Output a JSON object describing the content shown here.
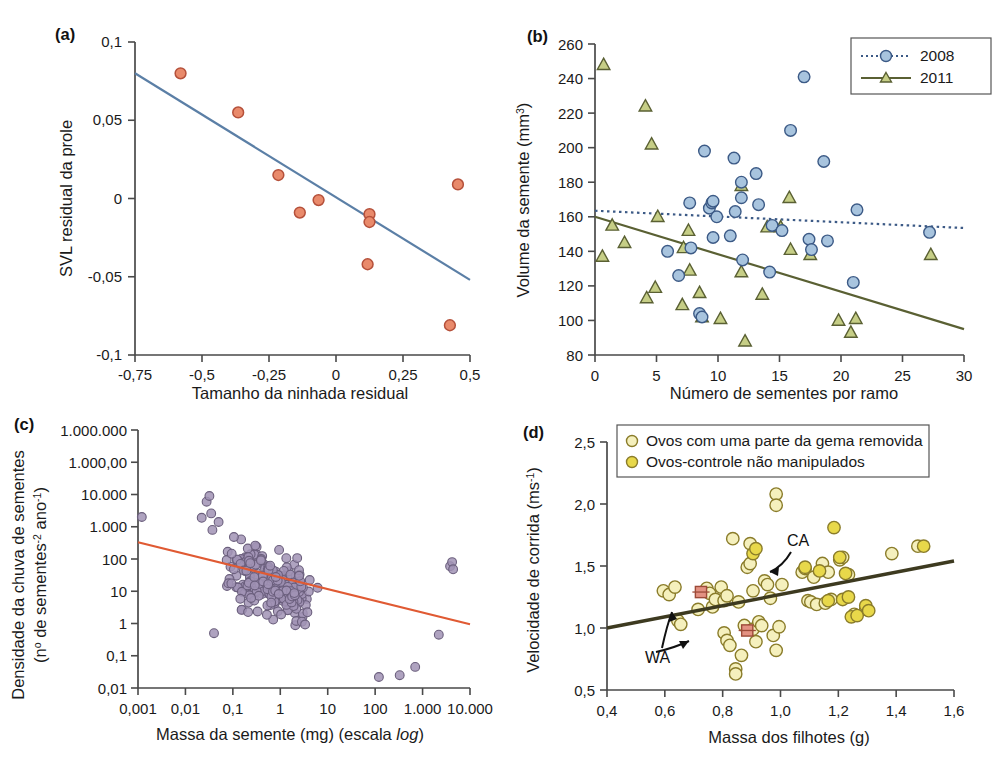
{
  "figure": {
    "kind": "multi-panel-scatter-figure",
    "panels": [
      "a",
      "b",
      "c",
      "d"
    ]
  },
  "panels": {
    "a": {
      "tag": "(a)",
      "xlabel": "Tamanho da ninhada residual",
      "ylabel": "SVL residual da prole",
      "xticks": [
        "-0,75",
        "-0,5",
        "-0,25",
        "0",
        "0,25",
        "0,5"
      ],
      "yticks": [
        "0,1",
        "0,05",
        "0",
        "-0,05",
        "-0,1"
      ]
    },
    "b": {
      "tag": "(b)",
      "xlabel": "Número de sementes por ramo",
      "ylabel_main": "Volume da semente (mm",
      "ylabel_sup": "3",
      "ylabel_tail": ")",
      "xticks": [
        "0",
        "5",
        "10",
        "15",
        "20",
        "25",
        "30"
      ],
      "yticks": [
        "260",
        "240",
        "220",
        "200",
        "180",
        "160",
        "140",
        "120",
        "100",
        "80"
      ],
      "legend": [
        {
          "label": "2008",
          "marker": "circle",
          "color": "#a8c4de",
          "line": "dotted",
          "line_color": "#3c5a86"
        },
        {
          "label": "2011",
          "marker": "triangle",
          "color": "#c6ce86",
          "line": "solid",
          "line_color": "#5a6033"
        }
      ]
    },
    "c": {
      "tag": "(c)",
      "xlabel_main": "Massa da semente (mg) (escala ",
      "xlabel_italic": "log",
      "xlabel_tail": ")",
      "ylabel_line1": "Densidade da chuva de sementes",
      "ylabel_line2_a": "(n",
      "ylabel_line2_sup1": "o",
      "ylabel_line2_b": " de sementes",
      "ylabel_line2_sup2": "-2",
      "ylabel_line2_c": " ano",
      "ylabel_line2_sup3": "-1",
      "ylabel_line2_d": ")",
      "xticks": [
        "0,001",
        "0,01",
        "0,1",
        "1",
        "10",
        "100",
        "1.000",
        "10.000"
      ],
      "yticks": [
        "1.000.000",
        "1.000,00",
        "10.000",
        "1.000",
        "100",
        "10",
        "1",
        "0,1",
        "0,01"
      ]
    },
    "d": {
      "tag": "(d)",
      "xlabel": "Massa dos filhotes (g)",
      "ylabel_main": "Velocidade de corrida  (ms",
      "ylabel_sup": "-1",
      "ylabel_tail": ")",
      "xticks": [
        "0,4",
        "0,6",
        "0,8",
        "1,0",
        "1,2",
        "1,4",
        "1,6"
      ],
      "yticks": [
        "2,5",
        "2,0",
        "1,5",
        "1,0",
        "0,5"
      ],
      "legend": [
        {
          "label": "Ovos com uma parte da gema removida",
          "marker": "circle",
          "color": "#f5f0bd"
        },
        {
          "label": "Ovos-controle não manipulados",
          "marker": "circle",
          "color": "#e8d84a"
        }
      ],
      "annotations": [
        {
          "label": "CA"
        },
        {
          "label": "WA"
        }
      ]
    }
  },
  "colors": {
    "panel_a_point_fill": "#e98a6b",
    "panel_a_point_stroke": "#b5503a",
    "panel_a_line": "#5b7fa6",
    "panel_b_2008_fill": "#a8c4de",
    "panel_b_2008_stroke": "#3c5a86",
    "panel_b_2011_fill": "#c6ce86",
    "panel_b_2011_stroke": "#5a6033",
    "panel_c_point_fill": "#a193b5",
    "panel_c_point_stroke": "#6b5f7d",
    "panel_c_line": "#e05a33",
    "panel_d_removed_fill": "#f5f0bd",
    "panel_d_control_fill": "#e8d84a",
    "panel_d_marker_stroke": "#8a7c2a",
    "panel_d_line": "#3d3a20",
    "panel_d_square_fill": "#e39182",
    "axis": "#4a4a4a"
  },
  "chart_data": [
    {
      "panel": "a",
      "type": "scatter",
      "title": "(a)",
      "xlabel": "Tamanho da ninhada residual",
      "ylabel": "SVL residual da prole",
      "xlim": [
        -0.75,
        0.5
      ],
      "ylim": [
        -0.1,
        0.1
      ],
      "grid": false,
      "points": [
        {
          "x": -0.58,
          "y": 0.08
        },
        {
          "x": -0.365,
          "y": 0.055
        },
        {
          "x": -0.215,
          "y": 0.015
        },
        {
          "x": -0.135,
          "y": -0.009
        },
        {
          "x": -0.065,
          "y": -0.001
        },
        {
          "x": 0.125,
          "y": -0.01
        },
        {
          "x": 0.125,
          "y": -0.015
        },
        {
          "x": 0.118,
          "y": -0.042
        },
        {
          "x": 0.455,
          "y": 0.009
        },
        {
          "x": 0.425,
          "y": -0.081
        }
      ],
      "trendline": {
        "x1": -0.75,
        "y1": 0.08,
        "x2": 0.5,
        "y2": -0.052,
        "color": "#5b7fa6"
      }
    },
    {
      "panel": "b",
      "type": "scatter",
      "title": "(b)",
      "xlabel": "Número de sementes por ramo",
      "ylabel": "Volume da semente (mm3)",
      "xlim": [
        0,
        30
      ],
      "ylim": [
        80,
        260
      ],
      "grid": false,
      "legend_position": "top-right",
      "series": [
        {
          "name": "2008",
          "marker": "circle",
          "points": [
            {
              "x": 5.9,
              "y": 140
            },
            {
              "x": 6.8,
              "y": 126
            },
            {
              "x": 7.7,
              "y": 168
            },
            {
              "x": 7.8,
              "y": 142
            },
            {
              "x": 8.5,
              "y": 104
            },
            {
              "x": 8.7,
              "y": 102
            },
            {
              "x": 8.9,
              "y": 198
            },
            {
              "x": 9.3,
              "y": 165
            },
            {
              "x": 9.5,
              "y": 168
            },
            {
              "x": 9.6,
              "y": 169
            },
            {
              "x": 9.9,
              "y": 160
            },
            {
              "x": 9.6,
              "y": 148
            },
            {
              "x": 11.0,
              "y": 149
            },
            {
              "x": 11.3,
              "y": 194
            },
            {
              "x": 11.4,
              "y": 163
            },
            {
              "x": 11.9,
              "y": 180
            },
            {
              "x": 11.9,
              "y": 171
            },
            {
              "x": 12.0,
              "y": 135
            },
            {
              "x": 13.1,
              "y": 185
            },
            {
              "x": 13.3,
              "y": 167
            },
            {
              "x": 14.2,
              "y": 128
            },
            {
              "x": 14.4,
              "y": 155
            },
            {
              "x": 15.2,
              "y": 152
            },
            {
              "x": 15.9,
              "y": 210
            },
            {
              "x": 17.0,
              "y": 241
            },
            {
              "x": 17.4,
              "y": 147
            },
            {
              "x": 17.6,
              "y": 141
            },
            {
              "x": 18.6,
              "y": 192
            },
            {
              "x": 18.9,
              "y": 146
            },
            {
              "x": 21.0,
              "y": 122
            },
            {
              "x": 21.3,
              "y": 164
            },
            {
              "x": 27.2,
              "y": 151
            }
          ],
          "trendline": {
            "x1": 0,
            "y1": 163.5,
            "x2": 30,
            "y2": 153.5,
            "style": "dotted"
          }
        },
        {
          "name": "2011",
          "marker": "triangle",
          "points": [
            {
              "x": 0.7,
              "y": 248
            },
            {
              "x": 0.6,
              "y": 137
            },
            {
              "x": 1.4,
              "y": 155
            },
            {
              "x": 2.4,
              "y": 145
            },
            {
              "x": 4.1,
              "y": 224
            },
            {
              "x": 4.2,
              "y": 113
            },
            {
              "x": 4.6,
              "y": 202
            },
            {
              "x": 4.9,
              "y": 119
            },
            {
              "x": 5.1,
              "y": 160
            },
            {
              "x": 7.2,
              "y": 142
            },
            {
              "x": 7.1,
              "y": 109
            },
            {
              "x": 7.6,
              "y": 152
            },
            {
              "x": 7.7,
              "y": 129
            },
            {
              "x": 8.7,
              "y": 102
            },
            {
              "x": 8.5,
              "y": 116
            },
            {
              "x": 10.2,
              "y": 101
            },
            {
              "x": 11.9,
              "y": 178
            },
            {
              "x": 11.9,
              "y": 128
            },
            {
              "x": 12.2,
              "y": 88
            },
            {
              "x": 13.6,
              "y": 115
            },
            {
              "x": 14.0,
              "y": 154
            },
            {
              "x": 15.1,
              "y": 154
            },
            {
              "x": 15.8,
              "y": 171
            },
            {
              "x": 15.9,
              "y": 141
            },
            {
              "x": 17.5,
              "y": 138
            },
            {
              "x": 19.8,
              "y": 100
            },
            {
              "x": 20.8,
              "y": 93
            },
            {
              "x": 21.2,
              "y": 101
            },
            {
              "x": 27.3,
              "y": 138
            }
          ],
          "trendline": {
            "x1": 0,
            "y1": 160,
            "x2": 30,
            "y2": 95,
            "style": "solid"
          }
        }
      ]
    },
    {
      "panel": "c",
      "type": "scatter",
      "title": "(c)",
      "xlabel": "Massa da semente (mg) (escala log)",
      "ylabel": "Densidade da chuva de sementes (no de sementes-2 ano-1)",
      "xlim": [
        0.001,
        10000
      ],
      "ylim": [
        0.01,
        1000000
      ],
      "xscale": "log",
      "yscale": "log",
      "grid": false,
      "n_points": 268,
      "note": "dense cloud of ~270 purple-grey points; negative log-log relationship",
      "trendline": {
        "x1": 0.001,
        "y1": 330,
        "x2": 10000,
        "y2": 0.95,
        "color": "#e05a33"
      }
    },
    {
      "panel": "d",
      "type": "scatter",
      "title": "(d)",
      "xlabel": "Massa dos filhotes (g)",
      "ylabel": "Velocidade de corrida (ms-1)",
      "xlim": [
        0.4,
        1.6
      ],
      "ylim": [
        0.5,
        2.5
      ],
      "grid": false,
      "legend_position": "top",
      "series": [
        {
          "name": "Ovos com uma parte da gema removida",
          "marker": "circle-pale",
          "points": [
            {
              "x": 0.595,
              "y": 1.3
            },
            {
              "x": 0.615,
              "y": 1.27
            },
            {
              "x": 0.635,
              "y": 1.33
            },
            {
              "x": 0.645,
              "y": 1.06
            },
            {
              "x": 0.655,
              "y": 1.03
            },
            {
              "x": 0.715,
              "y": 1.15
            },
            {
              "x": 0.745,
              "y": 1.32
            },
            {
              "x": 0.755,
              "y": 1.28
            },
            {
              "x": 0.765,
              "y": 1.17
            },
            {
              "x": 0.775,
              "y": 1.23
            },
            {
              "x": 0.795,
              "y": 1.33
            },
            {
              "x": 0.805,
              "y": 1.22
            },
            {
              "x": 0.815,
              "y": 1.26
            },
            {
              "x": 0.805,
              "y": 0.96
            },
            {
              "x": 0.815,
              "y": 0.9
            },
            {
              "x": 0.825,
              "y": 0.86
            },
            {
              "x": 0.835,
              "y": 1.72
            },
            {
              "x": 0.845,
              "y": 0.67
            },
            {
              "x": 0.845,
              "y": 0.63
            },
            {
              "x": 0.855,
              "y": 1.21
            },
            {
              "x": 0.865,
              "y": 0.78
            },
            {
              "x": 0.875,
              "y": 1.02
            },
            {
              "x": 0.885,
              "y": 1.49
            },
            {
              "x": 0.895,
              "y": 1.52
            },
            {
              "x": 0.895,
              "y": 1.68
            },
            {
              "x": 0.905,
              "y": 1.3
            },
            {
              "x": 0.905,
              "y": 0.99
            },
            {
              "x": 0.915,
              "y": 0.89
            },
            {
              "x": 0.925,
              "y": 1.05
            },
            {
              "x": 0.935,
              "y": 1.02
            },
            {
              "x": 0.945,
              "y": 1.38
            },
            {
              "x": 0.955,
              "y": 1.35
            },
            {
              "x": 0.965,
              "y": 1.24
            },
            {
              "x": 0.975,
              "y": 0.94
            },
            {
              "x": 0.985,
              "y": 2.08
            },
            {
              "x": 0.985,
              "y": 1.99
            },
            {
              "x": 0.985,
              "y": 0.82
            },
            {
              "x": 0.995,
              "y": 1.01
            },
            {
              "x": 1.005,
              "y": 1.35
            },
            {
              "x": 1.075,
              "y": 1.45
            },
            {
              "x": 1.085,
              "y": 1.48
            },
            {
              "x": 1.095,
              "y": 1.22
            },
            {
              "x": 1.105,
              "y": 1.21
            },
            {
              "x": 1.115,
              "y": 1.41
            },
            {
              "x": 1.125,
              "y": 1.19
            },
            {
              "x": 1.145,
              "y": 1.52
            },
            {
              "x": 1.155,
              "y": 1.2
            },
            {
              "x": 1.165,
              "y": 1.45
            },
            {
              "x": 1.175,
              "y": 1.23
            },
            {
              "x": 1.205,
              "y": 1.55
            },
            {
              "x": 1.215,
              "y": 1.57
            },
            {
              "x": 1.235,
              "y": 1.43
            },
            {
              "x": 1.255,
              "y": 1.11
            },
            {
              "x": 1.295,
              "y": 1.15
            },
            {
              "x": 1.385,
              "y": 1.6
            },
            {
              "x": 1.475,
              "y": 1.66
            }
          ]
        },
        {
          "name": "Ovos-controle não manipulados",
          "marker": "circle-dark",
          "points": [
            {
              "x": 0.905,
              "y": 1.6
            },
            {
              "x": 0.915,
              "y": 1.64
            },
            {
              "x": 1.085,
              "y": 1.49
            },
            {
              "x": 1.135,
              "y": 1.46
            },
            {
              "x": 1.165,
              "y": 1.22
            },
            {
              "x": 1.185,
              "y": 1.81
            },
            {
              "x": 1.205,
              "y": 1.57
            },
            {
              "x": 1.225,
              "y": 1.44
            },
            {
              "x": 1.215,
              "y": 1.23
            },
            {
              "x": 1.235,
              "y": 1.25
            },
            {
              "x": 1.245,
              "y": 1.09
            },
            {
              "x": 1.265,
              "y": 1.1
            },
            {
              "x": 1.295,
              "y": 1.18
            },
            {
              "x": 1.305,
              "y": 1.14
            },
            {
              "x": 1.495,
              "y": 1.66
            }
          ]
        }
      ],
      "special_markers": [
        {
          "label": "WA",
          "x": 0.725,
          "y": 1.29,
          "shape": "square",
          "color": "#e39182"
        },
        {
          "label": "WA",
          "x": 0.885,
          "y": 0.98,
          "shape": "square",
          "color": "#e39182"
        }
      ],
      "trendline": {
        "x1": 0.4,
        "y1": 1.0,
        "x2": 1.6,
        "y2": 1.54,
        "color": "#3d3a20"
      }
    }
  ]
}
